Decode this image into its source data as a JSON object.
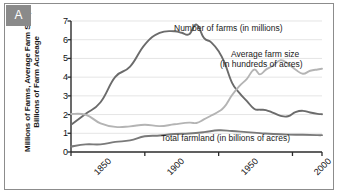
{
  "panel": {
    "label": "A"
  },
  "chart_data": {
    "type": "line",
    "title": "",
    "subtitle": "",
    "xlabel": "",
    "ylabel": "Millions of Farms, Average Farm Size, Billions of Farm Acreage",
    "xlim": [
      1850,
      2020
    ],
    "ylim": [
      0,
      7
    ],
    "yticks": [
      0,
      1,
      2,
      3,
      4,
      5,
      6,
      7
    ],
    "xticks": [
      1850,
      1900,
      1950,
      2000,
      2020
    ],
    "xticklabels": [
      "1850",
      "1900",
      "1950",
      "2000",
      "2020"
    ],
    "grid": "horizontal",
    "legend": "annotations-inline",
    "series": [
      {
        "name": "Number of farms (in millions)",
        "color": "#6b6b6b",
        "x": [
          1850,
          1860,
          1870,
          1880,
          1890,
          1900,
          1910,
          1920,
          1925,
          1930,
          1935,
          1940,
          1945,
          1950,
          1954,
          1959,
          1964,
          1969,
          1974,
          1978,
          1982,
          1987,
          1992,
          1997,
          2002,
          2007,
          2012,
          2017,
          2020
        ],
        "values": [
          1.45,
          2.04,
          2.66,
          4.01,
          4.56,
          5.74,
          6.36,
          6.45,
          6.37,
          6.29,
          6.81,
          6.1,
          5.86,
          5.38,
          4.78,
          3.71,
          3.16,
          2.73,
          2.31,
          2.26,
          2.24,
          2.09,
          1.93,
          1.91,
          2.13,
          2.2,
          2.11,
          2.04,
          2.02
        ]
      },
      {
        "name": "Average farm size (in hundreds of acres)",
        "color": "#b4b4b4",
        "x": [
          1850,
          1860,
          1870,
          1880,
          1890,
          1900,
          1910,
          1920,
          1930,
          1935,
          1940,
          1945,
          1950,
          1954,
          1959,
          1964,
          1969,
          1974,
          1978,
          1982,
          1987,
          1992,
          1997,
          2002,
          2007,
          2012,
          2017,
          2020
        ],
        "values": [
          2.03,
          1.99,
          1.53,
          1.34,
          1.37,
          1.46,
          1.38,
          1.48,
          1.57,
          1.55,
          1.74,
          1.95,
          2.16,
          2.42,
          3.03,
          3.52,
          3.9,
          4.4,
          4.15,
          4.4,
          4.62,
          4.91,
          4.71,
          4.41,
          4.18,
          4.34,
          4.41,
          4.45
        ]
      },
      {
        "name": "Total farmland (in billions of acres)",
        "color": "#7a7a7a",
        "x": [
          1850,
          1860,
          1870,
          1880,
          1890,
          1900,
          1910,
          1920,
          1930,
          1940,
          1950,
          1959,
          1969,
          1978,
          1987,
          1997,
          2007,
          2017,
          2020
        ],
        "values": [
          0.29,
          0.41,
          0.41,
          0.54,
          0.62,
          0.84,
          0.88,
          0.96,
          0.99,
          1.06,
          1.16,
          1.12,
          1.06,
          1.01,
          0.96,
          0.93,
          0.92,
          0.9,
          0.9
        ]
      }
    ],
    "annotations": [
      {
        "text": "Number of farms (in millions)",
        "x": 1930,
        "y": 6.5
      },
      {
        "text": "Average farm size",
        "x": 1965,
        "y": 5.2
      },
      {
        "text": "(in hundreds of acres)",
        "x": 1965,
        "y": 4.8
      },
      {
        "text": "Total farmland (in billions of acres)",
        "x": 1955,
        "y": 0.55
      }
    ]
  },
  "axis": {
    "ytick_labels": [
      "7",
      "6",
      "5",
      "4",
      "3",
      "2",
      "1",
      "0"
    ],
    "xtick_labels": [
      "1850",
      "1900",
      "1950",
      "2000",
      "2020"
    ]
  },
  "annotations_text": {
    "farms": "Number of farms (in millions)",
    "size_line1": "Average farm size",
    "size_line2": "(in hundreds of acres)",
    "farmland": "Total farmland (in billions of acres)"
  }
}
